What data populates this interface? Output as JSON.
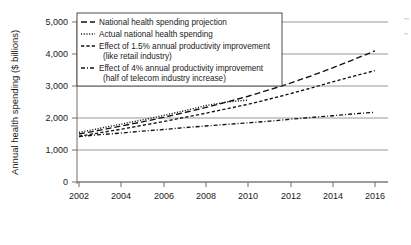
{
  "chart_data": {
    "type": "line",
    "title": "",
    "xlabel": "",
    "ylabel": "Annual health spending ($ billions)",
    "xlim": [
      2002,
      2016
    ],
    "ylim": [
      0,
      5000
    ],
    "grid": true,
    "legend_position": "top-left inside plot",
    "x_ticks": [
      "2002",
      "2004",
      "2006",
      "2008",
      "2010",
      "2012",
      "2014",
      "2016"
    ],
    "y_ticks": [
      "0",
      "1,000",
      "2,000",
      "3,000",
      "4,000",
      "5,000"
    ],
    "series": [
      {
        "name": "National health spending projection",
        "style": "dashed",
        "x": [
          2002,
          2003,
          2004,
          2005,
          2006,
          2007,
          2008,
          2009,
          2010,
          2011,
          2012,
          2013,
          2014,
          2015,
          2016
        ],
        "values": [
          1500,
          1620,
          1750,
          1880,
          2020,
          2170,
          2330,
          2500,
          2680,
          2880,
          3090,
          3320,
          3570,
          3830,
          4100
        ]
      },
      {
        "name": "Actual national health spending",
        "style": "dotted",
        "x": [
          2002,
          2003,
          2004,
          2005,
          2006,
          2007,
          2008,
          2009,
          2010
        ],
        "values": [
          1550,
          1680,
          1810,
          1940,
          2080,
          2230,
          2390,
          2500,
          2560
        ]
      },
      {
        "name": "Effect of 1.5% annual productivity improvement (like retail industry)",
        "style": "dashed-short",
        "x": [
          2002,
          2003,
          2004,
          2005,
          2006,
          2007,
          2008,
          2009,
          2010,
          2011,
          2012,
          2013,
          2014,
          2015,
          2016
        ],
        "values": [
          1430,
          1540,
          1650,
          1770,
          1890,
          2020,
          2150,
          2290,
          2430,
          2590,
          2760,
          2940,
          3130,
          3310,
          3480
        ]
      },
      {
        "name": "Effect of 4% annual productivity improvement (half of telecom industry increase)",
        "style": "dash-dot",
        "x": [
          2002,
          2003,
          2004,
          2005,
          2006,
          2007,
          2008,
          2009,
          2010,
          2011,
          2012,
          2013,
          2014,
          2015,
          2016
        ],
        "values": [
          1420,
          1480,
          1530,
          1590,
          1640,
          1700,
          1750,
          1800,
          1850,
          1900,
          1960,
          2020,
          2070,
          2130,
          2180
        ]
      }
    ]
  },
  "axis": {
    "y_title": "Annual health spending ($ billions)",
    "y_ticks": [
      "5,000",
      "4,000",
      "3,000",
      "2,000",
      "1,000",
      "0"
    ],
    "x_ticks": [
      "2002",
      "2004",
      "2006",
      "2008",
      "2010",
      "2012",
      "2014",
      "2016"
    ]
  },
  "legend": {
    "entries": [
      {
        "line1": "National health spending projection",
        "line2": ""
      },
      {
        "line1": "Actual national health spending",
        "line2": ""
      },
      {
        "line1": "Effect of 1.5% annual productivity improvement",
        "line2": "(like retail industry)"
      },
      {
        "line1": "Effect of 4% annual productivity improvement",
        "line2": "(half of telecom industry increase)"
      }
    ]
  }
}
